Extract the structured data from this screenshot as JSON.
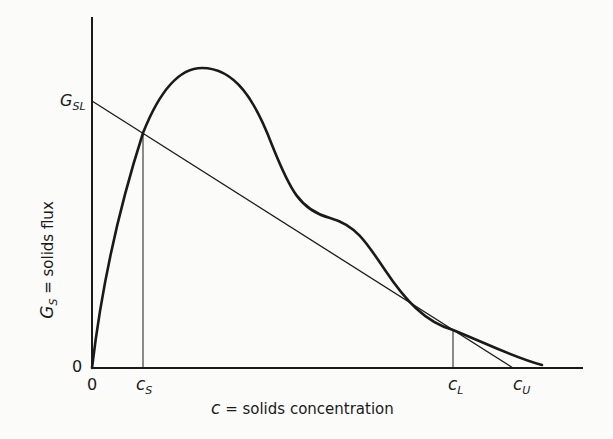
{
  "diagram": {
    "y_axis": {
      "label_symbol": "G",
      "label_sub": "S",
      "label_rest": " = solids flux",
      "origin_label": "0",
      "tick_symbol": "G",
      "tick_sub": "SL"
    },
    "x_axis": {
      "label_symbol": "c",
      "label_rest": " = solids concentration",
      "origin_label": "0",
      "ticks": [
        {
          "symbol": "c",
          "sub": "S"
        },
        {
          "symbol": "c",
          "sub": "L"
        },
        {
          "symbol": "c",
          "sub": "U"
        }
      ]
    },
    "colors": {
      "line": "#1a1a1a",
      "background": "#fbfbfa"
    }
  }
}
